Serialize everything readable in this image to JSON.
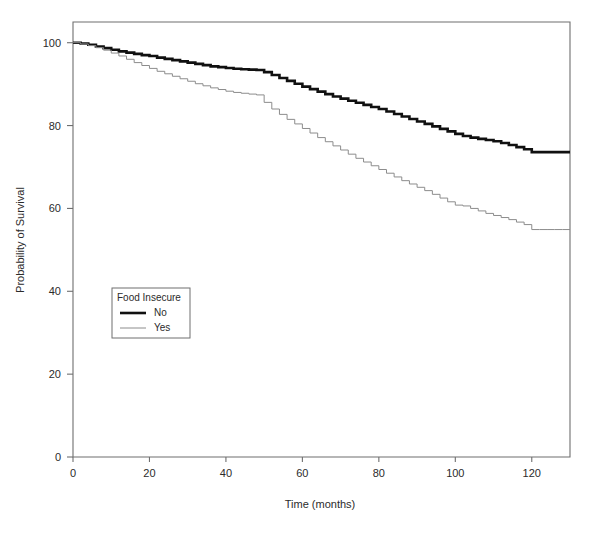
{
  "chart_data": {
    "type": "line",
    "title": "",
    "xlabel": "Time (months)",
    "ylabel": "Probability of Survival",
    "xlim": [
      0,
      130
    ],
    "ylim": [
      0,
      105
    ],
    "xticks": [
      0,
      20,
      40,
      60,
      80,
      100,
      120
    ],
    "xtick_labels": [
      "0",
      "20",
      "40",
      "60",
      "80",
      "100",
      "120"
    ],
    "yticks": [
      0,
      20,
      40,
      60,
      80,
      100
    ],
    "ytick_labels": [
      "0",
      "20",
      "40",
      "60",
      "80",
      "100"
    ],
    "grid": false,
    "legend_position": "center-left",
    "legend_title": "Food Insecure",
    "series": [
      {
        "name": "No",
        "color": "#101010",
        "line_width": 2.6,
        "x": [
          0,
          2,
          4,
          6,
          8,
          10,
          12,
          14,
          16,
          18,
          20,
          22,
          24,
          26,
          28,
          30,
          32,
          34,
          36,
          38,
          40,
          42,
          44,
          46,
          48,
          50,
          52,
          54,
          56,
          58,
          60,
          62,
          64,
          66,
          68,
          70,
          72,
          74,
          76,
          78,
          80,
          82,
          84,
          86,
          88,
          90,
          92,
          94,
          96,
          98,
          100,
          102,
          104,
          106,
          108,
          110,
          112,
          114,
          116,
          118,
          120,
          122,
          124,
          126,
          128,
          130
        ],
        "y": [
          100.0,
          99.8,
          99.5,
          99.1,
          98.7,
          98.3,
          97.9,
          97.6,
          97.3,
          97.0,
          96.8,
          96.4,
          96.1,
          95.8,
          95.5,
          95.2,
          94.9,
          94.6,
          94.3,
          94.1,
          93.9,
          93.7,
          93.6,
          93.5,
          93.4,
          92.9,
          92.2,
          91.5,
          90.8,
          90.1,
          89.4,
          88.8,
          88.2,
          87.6,
          87.0,
          86.5,
          86.0,
          85.5,
          85.0,
          84.5,
          84.0,
          83.4,
          82.8,
          82.2,
          81.6,
          81.0,
          80.4,
          79.8,
          79.2,
          78.6,
          78.0,
          77.5,
          77.1,
          76.8,
          76.5,
          76.2,
          75.8,
          75.3,
          74.8,
          74.3,
          73.6,
          73.6,
          73.6,
          73.6,
          73.6,
          73.6
        ]
      },
      {
        "name": "Yes",
        "color": "#8c8c8c",
        "line_width": 1.0,
        "x": [
          0,
          2,
          4,
          6,
          8,
          10,
          12,
          14,
          16,
          18,
          20,
          22,
          24,
          26,
          28,
          30,
          32,
          34,
          36,
          38,
          40,
          42,
          44,
          46,
          48,
          50,
          52,
          54,
          56,
          58,
          60,
          62,
          64,
          66,
          68,
          70,
          72,
          74,
          76,
          78,
          80,
          82,
          84,
          86,
          88,
          90,
          92,
          94,
          96,
          98,
          100,
          102,
          104,
          106,
          108,
          110,
          112,
          114,
          116,
          118,
          120,
          122,
          124,
          126,
          128,
          130
        ],
        "y": [
          100.0,
          99.7,
          99.3,
          98.8,
          98.2,
          97.5,
          96.8,
          96.0,
          95.2,
          94.5,
          93.8,
          93.1,
          92.5,
          91.9,
          91.3,
          90.7,
          90.1,
          89.6,
          89.1,
          88.7,
          88.3,
          88.0,
          87.8,
          87.6,
          87.4,
          85.6,
          84.0,
          82.7,
          81.5,
          80.4,
          79.3,
          78.2,
          77.1,
          76.1,
          75.1,
          74.1,
          73.1,
          72.1,
          71.2,
          70.3,
          69.4,
          68.5,
          67.6,
          66.7,
          65.9,
          65.1,
          64.3,
          63.4,
          62.5,
          61.6,
          60.8,
          60.6,
          60.0,
          59.4,
          58.8,
          58.3,
          57.8,
          57.3,
          56.7,
          56.1,
          54.9,
          54.9,
          54.9,
          54.9,
          54.9,
          54.9
        ]
      }
    ]
  }
}
